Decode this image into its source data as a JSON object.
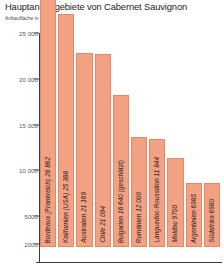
{
  "chart_data": {
    "type": "bar",
    "title": "Hauptanbaugebiete von Cabernet Sauvignon",
    "subtitle": "Anbaufläche in ha",
    "xlabel": "",
    "ylabel": "",
    "ylim": [
      0,
      26500
    ],
    "grid": false,
    "legend": null,
    "yticks": [
      {
        "value": 25000,
        "label": "25 000"
      },
      {
        "value": 20000,
        "label": "20 000"
      },
      {
        "value": 15000,
        "label": "15 000"
      },
      {
        "value": 10000,
        "label": "10 000"
      },
      {
        "value": 5000,
        "label": "5000"
      },
      {
        "value": 2000,
        "label": "2000"
      }
    ],
    "categories": [
      "Bordeaux (Frankreich)",
      "Kalifornien (USA)",
      "Australien",
      "Chile",
      "Bulgarien",
      "Rumänien",
      "Languedoc-Roussillon",
      "Moldau",
      "Argentinien",
      "Südafrika"
    ],
    "values": [
      28862,
      25388,
      21169,
      21094,
      16640,
      12000,
      11844,
      9700,
      6985,
      6980
    ],
    "bar_labels": [
      "Bordeaux (Frankreich) 28 862",
      "Kalifornien (USA) 25 388",
      "Australien 21 169",
      "Chile 21 094",
      "Bulgarien 16 640 (geschätzt)",
      "Rumänien 12 000",
      "Languedoc-Roussillon 11 844",
      "Moldau 9700",
      "Argentinien 6985",
      "Südafrika 6980"
    ],
    "bar_color": "#F3A183",
    "bar_border_color": "#E8866A",
    "axis_color": "#3a3a3a",
    "title_color": "#1d1d1d"
  }
}
